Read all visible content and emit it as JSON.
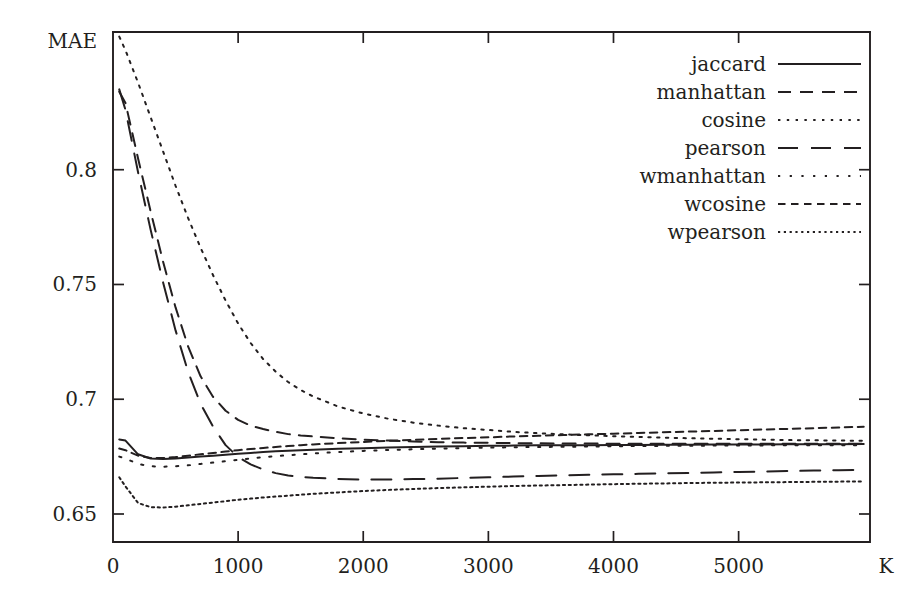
{
  "chart_data": {
    "type": "line",
    "title": "",
    "xlabel": "K",
    "ylabel": "MAE",
    "xlim": [
      0,
      6050
    ],
    "ylim": [
      0.6378,
      0.86
    ],
    "grid": false,
    "legend_position": "top-right",
    "xticks": [
      0,
      1000,
      2000,
      3000,
      4000,
      5000
    ],
    "xtick_labels": [
      "0",
      "1000",
      "2000",
      "3000",
      "4000",
      "5000"
    ],
    "yticks": [
      0.65,
      0.7,
      0.75,
      0.8
    ],
    "ytick_labels": [
      "0.65",
      "0.7",
      "0.75",
      "0.8"
    ],
    "x": [
      50,
      100,
      200,
      300,
      400,
      500,
      600,
      700,
      800,
      900,
      1000,
      1100,
      1200,
      1300,
      1400,
      1500,
      1600,
      1800,
      2000,
      2200,
      2400,
      2600,
      2800,
      3000,
      3200,
      3400,
      3600,
      3800,
      4000,
      4200,
      4400,
      4600,
      4800,
      5000,
      5200,
      5400,
      5600,
      5800,
      6000
    ],
    "series": [
      {
        "name": "jaccard",
        "dash": "solid",
        "values": [
          0.6825,
          0.682,
          0.676,
          0.6742,
          0.674,
          0.6742,
          0.6746,
          0.675,
          0.6754,
          0.6758,
          0.6762,
          0.6766,
          0.677,
          0.6773,
          0.6776,
          0.6778,
          0.678,
          0.6784,
          0.6787,
          0.679,
          0.6792,
          0.6794,
          0.6795,
          0.6797,
          0.6798,
          0.6799,
          0.68,
          0.68,
          0.6801,
          0.6801,
          0.6802,
          0.6802,
          0.6803,
          0.6803,
          0.6803,
          0.6804,
          0.6804,
          0.6804,
          0.6805
        ]
      },
      {
        "name": "manhattan",
        "dash": "dashed",
        "values": [
          0.834,
          0.829,
          0.805,
          0.782,
          0.76,
          0.74,
          0.723,
          0.71,
          0.701,
          0.695,
          0.691,
          0.6885,
          0.687,
          0.6858,
          0.6848,
          0.6842,
          0.6838,
          0.683,
          0.6824,
          0.682,
          0.6816,
          0.6813,
          0.6811,
          0.681,
          0.6809,
          0.6808,
          0.6807,
          0.6807,
          0.6806,
          0.6806,
          0.6806,
          0.6806,
          0.6806,
          0.6806,
          0.6806,
          0.6806,
          0.6806,
          0.6806,
          0.6806
        ]
      },
      {
        "name": "cosine",
        "dash": "dotted",
        "values": [
          0.858,
          0.852,
          0.838,
          0.823,
          0.808,
          0.793,
          0.779,
          0.766,
          0.754,
          0.743,
          0.733,
          0.7245,
          0.7175,
          0.712,
          0.7075,
          0.704,
          0.7012,
          0.6968,
          0.6938,
          0.6915,
          0.6898,
          0.6885,
          0.6874,
          0.6866,
          0.6858,
          0.6852,
          0.6847,
          0.6843,
          0.6839,
          0.6836,
          0.6833,
          0.683,
          0.6828,
          0.6826,
          0.6824,
          0.6822,
          0.6821,
          0.682,
          0.6819
        ]
      },
      {
        "name": "pearson",
        "dash": "longdash",
        "values": [
          0.835,
          0.826,
          0.799,
          0.774,
          0.751,
          0.73,
          0.712,
          0.698,
          0.688,
          0.68,
          0.6748,
          0.6716,
          0.6694,
          0.6678,
          0.6668,
          0.6662,
          0.6658,
          0.6653,
          0.665,
          0.665,
          0.6652,
          0.6654,
          0.6657,
          0.666,
          0.6663,
          0.6666,
          0.6668,
          0.6671,
          0.6673,
          0.6675,
          0.6677,
          0.6679,
          0.6681,
          0.6683,
          0.6685,
          0.6687,
          0.6689,
          0.6691,
          0.6693
        ]
      },
      {
        "name": "wmanhattan",
        "dash": "sparsedot",
        "values": [
          0.675,
          0.6742,
          0.6718,
          0.6708,
          0.6706,
          0.6708,
          0.6712,
          0.6718,
          0.6724,
          0.673,
          0.6736,
          0.6742,
          0.6748,
          0.6752,
          0.6756,
          0.676,
          0.6764,
          0.677,
          0.6775,
          0.6779,
          0.6782,
          0.6785,
          0.6787,
          0.6789,
          0.6791,
          0.6792,
          0.6793,
          0.6794,
          0.6795,
          0.6796,
          0.6797,
          0.6797,
          0.6798,
          0.6798,
          0.6799,
          0.6799,
          0.68,
          0.68,
          0.68
        ]
      },
      {
        "name": "wcosine",
        "dash": "shortdash",
        "values": [
          0.6785,
          0.6778,
          0.6754,
          0.6744,
          0.6744,
          0.6748,
          0.6754,
          0.676,
          0.6766,
          0.6772,
          0.6778,
          0.6783,
          0.6788,
          0.6792,
          0.6796,
          0.68,
          0.6803,
          0.6809,
          0.6814,
          0.6819,
          0.6823,
          0.6827,
          0.6831,
          0.6834,
          0.6838,
          0.6841,
          0.6844,
          0.6847,
          0.685,
          0.6853,
          0.6856,
          0.6859,
          0.6862,
          0.6865,
          0.6868,
          0.6871,
          0.6874,
          0.6877,
          0.688
        ]
      },
      {
        "name": "wpearson",
        "dash": "finedot",
        "values": [
          0.666,
          0.662,
          0.6548,
          0.653,
          0.6528,
          0.6532,
          0.6538,
          0.6544,
          0.655,
          0.6556,
          0.6562,
          0.6567,
          0.6572,
          0.6576,
          0.658,
          0.6584,
          0.6588,
          0.6594,
          0.66,
          0.6605,
          0.6609,
          0.6613,
          0.6616,
          0.6619,
          0.6622,
          0.6624,
          0.6626,
          0.6628,
          0.663,
          0.6632,
          0.6633,
          0.6635,
          0.6636,
          0.6637,
          0.6638,
          0.6639,
          0.664,
          0.6641,
          0.6642
        ]
      }
    ]
  },
  "legend": {
    "entries": [
      {
        "label": "jaccard"
      },
      {
        "label": "manhattan"
      },
      {
        "label": "cosine"
      },
      {
        "label": "pearson"
      },
      {
        "label": "wmanhattan"
      },
      {
        "label": "wcosine"
      },
      {
        "label": "wpearson"
      }
    ]
  }
}
